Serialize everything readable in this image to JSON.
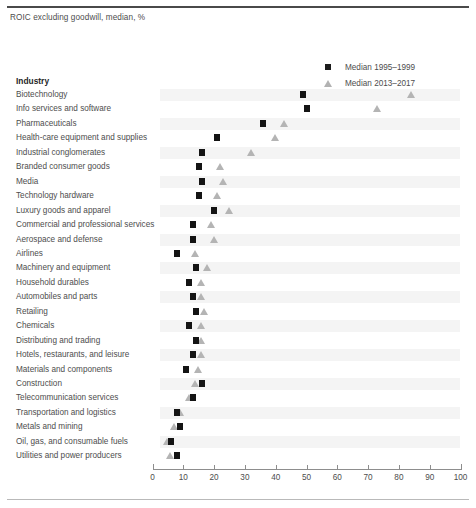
{
  "subtitle": "ROIC excluding goodwill, median, %",
  "column_header": "Industry",
  "legend": {
    "series1_label": "Median 1995–1999",
    "series2_label": "Median 2013–2017",
    "series1_color": "#1c1c1c",
    "series2_color": "#b2b2b2"
  },
  "chart_data": {
    "type": "scatter",
    "title": "",
    "subtitle": "ROIC excluding goodwill, median, %",
    "xlabel": "",
    "ylabel": "Industry",
    "xlim": [
      0,
      100
    ],
    "xticks": [
      0,
      10,
      20,
      30,
      40,
      50,
      60,
      70,
      80,
      90,
      100
    ],
    "xtick_labels": [
      "0",
      "10",
      "20",
      "30",
      "40",
      "50",
      "60",
      "70",
      "80",
      "90",
      "100"
    ],
    "grid": false,
    "legend_position": "top-right",
    "categories": [
      "Biotechnology",
      "Info services and software",
      "Pharmaceuticals",
      "Health-care equipment and supplies",
      "Industrial conglomerates",
      "Branded consumer goods",
      "Media",
      "Technology hardware",
      "Luxury goods and apparel",
      "Commercial and professional services",
      "Aerospace and defense",
      "Airlines",
      "Machinery and equipment",
      "Household durables",
      "Automobiles and parts",
      "Retailing",
      "Chemicals",
      "Distributing and trading",
      "Hotels, restaurants, and leisure",
      "Materials and components",
      "Construction",
      "Telecommunication services",
      "Transportation and logistics",
      "Metals and mining",
      "Oil, gas, and consumable fuels",
      "Utilities and power producers"
    ],
    "series": [
      {
        "name": "Median 1995–1999",
        "marker": "square",
        "color": "#1c1c1c",
        "values": [
          49,
          50,
          36,
          21,
          16,
          15,
          16,
          15,
          20,
          13,
          13,
          8,
          14,
          12,
          13,
          14,
          12,
          14,
          13,
          11,
          16,
          13,
          8,
          9,
          6,
          8
        ]
      },
      {
        "name": "Median 2013–2017",
        "marker": "triangle",
        "color": "#b2b2b2",
        "values": [
          84,
          73,
          43,
          40,
          32,
          22,
          23,
          21,
          25,
          19,
          20,
          14,
          18,
          16,
          16,
          17,
          16,
          16,
          16,
          15,
          14,
          12,
          9,
          7,
          5,
          6
        ]
      }
    ]
  }
}
